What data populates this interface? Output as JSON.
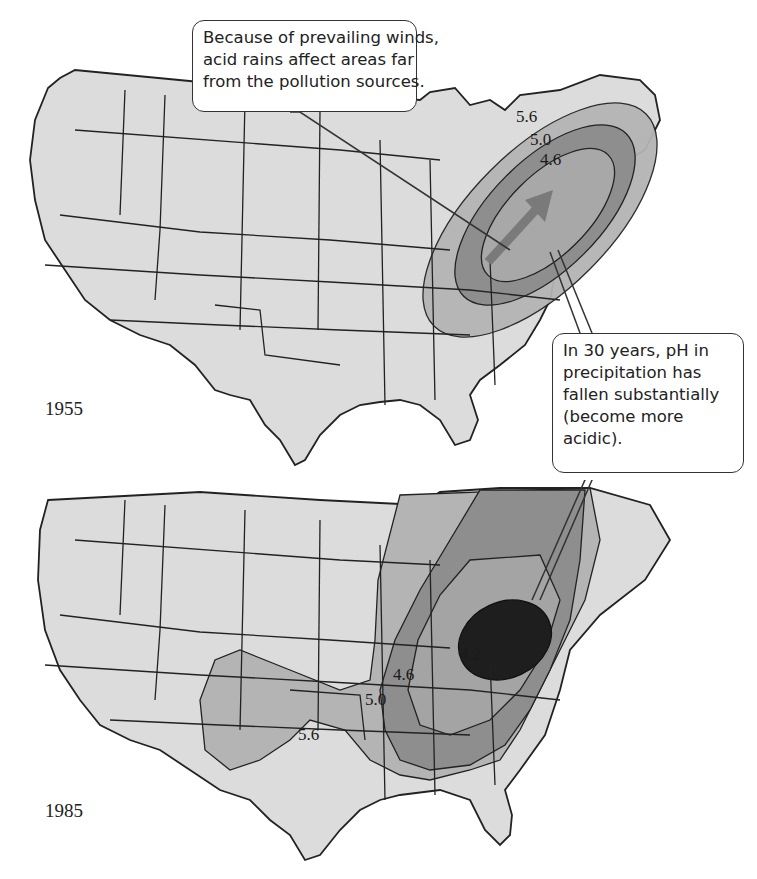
{
  "figure": {
    "colors": {
      "background": "#ffffff",
      "land": "#dcdcdc",
      "ph_5_6": "#b4b4b4",
      "ph_5_0": "#8e8e8e",
      "ph_4_6": "#a2a2a2",
      "ph_4_2": "#1e1e1e",
      "border": "#222222",
      "arrow": "#7a7a7a"
    }
  },
  "maps": [
    {
      "year_label": "1955",
      "isolines": [
        {
          "label": "5.6"
        },
        {
          "label": "5.0"
        },
        {
          "label": "4.6"
        }
      ],
      "annotation": "prevailing-wind-arrow"
    },
    {
      "year_label": "1985",
      "isolines": [
        {
          "label": "5.6"
        },
        {
          "label": "5.0"
        },
        {
          "label": "4.6"
        },
        {
          "label": "4.2"
        }
      ]
    }
  ],
  "callouts": {
    "winds": {
      "lines": [
        "Because of prevailing winds,",
        "acid rains affect areas far",
        "from the pollution sources."
      ]
    },
    "ph_change": {
      "lines": [
        "In 30 years, pH in",
        "precipitation has",
        "fallen substantially",
        "(become more",
        "acidic)."
      ]
    }
  }
}
